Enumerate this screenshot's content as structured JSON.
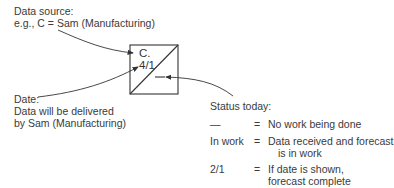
{
  "data_source": {
    "label": "Data source:",
    "example": "e.g., C = Sam (Manufacturing)"
  },
  "box": {
    "source_code": "C.",
    "date": "4/1"
  },
  "date_note": {
    "label": "Date:",
    "line1": "Data will be delivered",
    "line2": "by Sam (Manufacturing)"
  },
  "status": {
    "title": "Status today:",
    "rows": [
      {
        "key": "—",
        "eq": "=",
        "desc_line1": "No work being done",
        "desc_line2": ""
      },
      {
        "key": "In work",
        "eq": "=",
        "desc_line1": "Data received and forecast",
        "desc_line2": "   is in work"
      },
      {
        "key": "2/1",
        "eq": "=",
        "desc_line1": "If date is shown,",
        "desc_line2": "forecast complete"
      }
    ]
  }
}
